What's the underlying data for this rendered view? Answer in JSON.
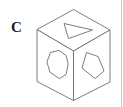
{
  "figure": {
    "label": "C",
    "caption": "",
    "type": "isometric-cube-with-face-shapes",
    "background_color": "#ffffff",
    "stroke_color": "#6e6e6e",
    "label_color": "#1a1a1a",
    "stroke_width": 0.9,
    "canvas": {
      "width": 123,
      "height": 107
    }
  },
  "cube": {
    "name": "isometric-cube",
    "vertices": {
      "top": [
        73.5,
        9.5
      ],
      "upper_left": [
        37.0,
        29.5
      ],
      "upper_right": [
        110.0,
        30.0
      ],
      "center": [
        73.5,
        51.0
      ],
      "lower_left": [
        37.0,
        81.5
      ],
      "lower_right": [
        110.0,
        82.0
      ],
      "bottom": [
        73.5,
        100.5
      ]
    },
    "faces": [
      {
        "name": "top-face",
        "orientation": "top",
        "outline": "73.5,9.5 110.0,30.0 73.5,51.0 37.0,29.5",
        "shape": {
          "name": "triangle",
          "sides": 3,
          "points": "64.0,23.5 92.5,30.0 68.5,38.5"
        }
      },
      {
        "name": "left-face",
        "orientation": "left",
        "outline": "37.0,29.5 73.5,51.0 73.5,100.5 37.0,81.5",
        "shape": {
          "name": "heptagon",
          "sides": 7,
          "points": "50.5,52.5 59.0,50.5 66.0,55.5 68.0,64.0 66.0,74.5 59.5,78.5 50.0,72.0 47.0,62.0"
        }
      },
      {
        "name": "right-face",
        "orientation": "right",
        "outline": "73.5,51.0 110.0,30.0 110.0,82.0 73.5,100.5"
      }
    ]
  },
  "shapes": [
    {
      "name": "top-face-triangle",
      "face": "top-face",
      "sides": 3,
      "description": "triangle pointing right"
    },
    {
      "name": "left-face-heptagon",
      "face": "left-face",
      "sides": 7,
      "description": "rounded irregular heptagon"
    },
    {
      "name": "right-face-pentagon",
      "face": "right-face",
      "sides": 5,
      "description": "irregular pentagon",
      "points": "86.5,52.5 98.0,56.5 104.0,71.0 95.0,78.5 82.0,68.0"
    }
  ],
  "edge_marker": {
    "name": "right-edge-rule",
    "x": 121.5,
    "y_start": 0,
    "y_end": 107,
    "color": "#c8c8c8"
  }
}
